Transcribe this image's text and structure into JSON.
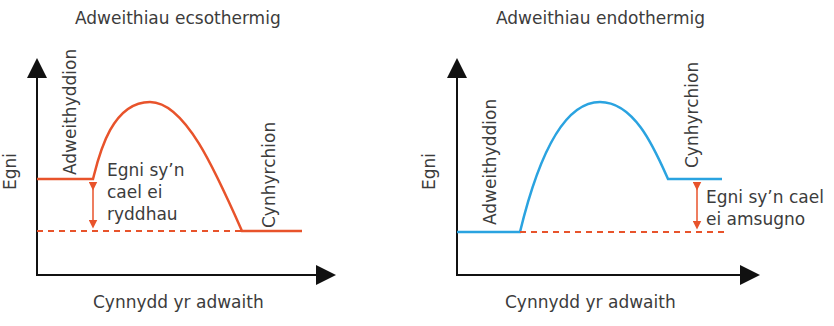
{
  "diagrams": [
    {
      "title": "Adweithiau ecsothermig",
      "ylabel": "Egni",
      "xlabel": "Cynnydd yr adwaith",
      "reactants_label": "Adweithyddion",
      "products_label": "Cynhyrchion",
      "energy_label_lines": [
        "Egni sy’n",
        "cael ei",
        "ryddhau"
      ],
      "curve_color": "#e8532b"
    },
    {
      "title": "Adweithiau endothermig",
      "ylabel": "Egni",
      "xlabel": "Cynnydd yr adwaith",
      "reactants_label": "Adweithyddion",
      "products_label": "Cynhyrchion",
      "energy_label_lines": [
        "Egni sy’n cael",
        "ei amsugno"
      ],
      "curve_color": "#2aa3e0"
    }
  ],
  "colors": {
    "axis": "#111111",
    "arrow": "#e8532b",
    "dashed": "#e8532b"
  }
}
